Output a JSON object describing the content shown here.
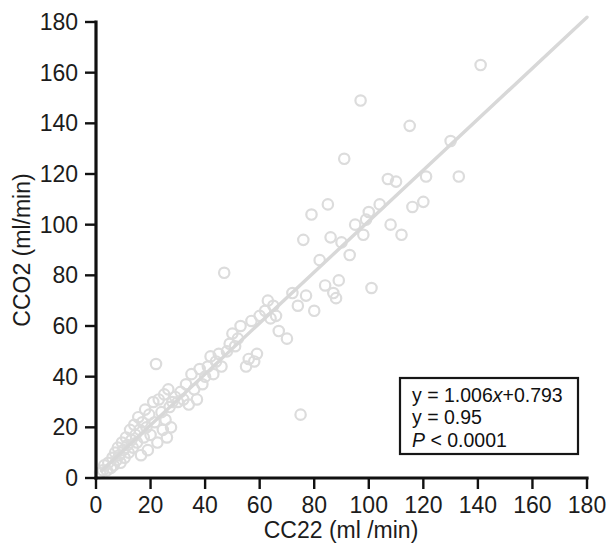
{
  "chart_data": {
    "type": "scatter",
    "title": "",
    "xlabel": "CC22 (ml /min)",
    "ylabel": "CCO2 (ml/min)",
    "xlim": [
      0,
      180
    ],
    "ylim": [
      0,
      180
    ],
    "xticks": [
      0,
      20,
      40,
      60,
      80,
      100,
      120,
      140,
      160,
      180
    ],
    "yticks": [
      0,
      20,
      40,
      60,
      80,
      100,
      120,
      140,
      160,
      180
    ],
    "xtick_labels": [
      "0",
      "20",
      "40",
      "60",
      "80",
      "100",
      "120",
      "140",
      "160",
      "180"
    ],
    "ytick_labels": [
      "0",
      "20",
      "40",
      "60",
      "80",
      "100",
      "120",
      "140",
      "160",
      "180"
    ],
    "grid": false,
    "legend": "none",
    "marker": "open-circle",
    "marker_color": "#dcdcdc",
    "trendline_color": "#d8d8d8",
    "axis_color": "#111111",
    "trendline": {
      "slope": 1.006,
      "intercept": 0.793,
      "x_start": 2,
      "x_end": 180
    },
    "points": [
      [
        1.5,
        2
      ],
      [
        2.5,
        3
      ],
      [
        3,
        5
      ],
      [
        4,
        3
      ],
      [
        4.5,
        6
      ],
      [
        5.5,
        4
      ],
      [
        6,
        8
      ],
      [
        6.5,
        5
      ],
      [
        7,
        10
      ],
      [
        7.5,
        7
      ],
      [
        8,
        12
      ],
      [
        8.5,
        9
      ],
      [
        9,
        6
      ],
      [
        9.5,
        14
      ],
      [
        10,
        11
      ],
      [
        10.5,
        8
      ],
      [
        11,
        16
      ],
      [
        11.5,
        13
      ],
      [
        12,
        10
      ],
      [
        12.5,
        19
      ],
      [
        13,
        15
      ],
      [
        13.5,
        12
      ],
      [
        14,
        21
      ],
      [
        14.5,
        17
      ],
      [
        15,
        14
      ],
      [
        15.5,
        24
      ],
      [
        16,
        19
      ],
      [
        16.5,
        9
      ],
      [
        17,
        22
      ],
      [
        17.5,
        16
      ],
      [
        18,
        27
      ],
      [
        18.5,
        20
      ],
      [
        19,
        11
      ],
      [
        19.5,
        25
      ],
      [
        20,
        17
      ],
      [
        21,
        30
      ],
      [
        21.5,
        22
      ],
      [
        22,
        45
      ],
      [
        22.5,
        14
      ],
      [
        23,
        31
      ],
      [
        24,
        26
      ],
      [
        24.5,
        19
      ],
      [
        25,
        33
      ],
      [
        25.5,
        23
      ],
      [
        26,
        16
      ],
      [
        26.5,
        35
      ],
      [
        27,
        28
      ],
      [
        27.5,
        20
      ],
      [
        28,
        30
      ],
      [
        29,
        32
      ],
      [
        30,
        30
      ],
      [
        31,
        34
      ],
      [
        32,
        31
      ],
      [
        33,
        37
      ],
      [
        34,
        29
      ],
      [
        35,
        41
      ],
      [
        36,
        35
      ],
      [
        37,
        31
      ],
      [
        38,
        43
      ],
      [
        39,
        37
      ],
      [
        40,
        40
      ],
      [
        41,
        44
      ],
      [
        42,
        48
      ],
      [
        43,
        41
      ],
      [
        44,
        46
      ],
      [
        45,
        49
      ],
      [
        46,
        44
      ],
      [
        47,
        81
      ],
      [
        48,
        50
      ],
      [
        49,
        53
      ],
      [
        50,
        57
      ],
      [
        51,
        52
      ],
      [
        52,
        55
      ],
      [
        53,
        60
      ],
      [
        55,
        44
      ],
      [
        56,
        47
      ],
      [
        57,
        62
      ],
      [
        58,
        46
      ],
      [
        59,
        49
      ],
      [
        60,
        64
      ],
      [
        62,
        66
      ],
      [
        63,
        70
      ],
      [
        64,
        63
      ],
      [
        65,
        68
      ],
      [
        66,
        64
      ],
      [
        67,
        58
      ],
      [
        70,
        55
      ],
      [
        72,
        73
      ],
      [
        74,
        68
      ],
      [
        75,
        25
      ],
      [
        76,
        94
      ],
      [
        77,
        72
      ],
      [
        79,
        104
      ],
      [
        80,
        66
      ],
      [
        82,
        86
      ],
      [
        84,
        76
      ],
      [
        85,
        108
      ],
      [
        86,
        95
      ],
      [
        87,
        73
      ],
      [
        88,
        71
      ],
      [
        89,
        78
      ],
      [
        90,
        93
      ],
      [
        91,
        126
      ],
      [
        93,
        88
      ],
      [
        95,
        100
      ],
      [
        97,
        149
      ],
      [
        98,
        96
      ],
      [
        99,
        102
      ],
      [
        100,
        105
      ],
      [
        101,
        75
      ],
      [
        104,
        108
      ],
      [
        107,
        118
      ],
      [
        108,
        100
      ],
      [
        110,
        117
      ],
      [
        112,
        96
      ],
      [
        115,
        139
      ],
      [
        116,
        107
      ],
      [
        120,
        109
      ],
      [
        121,
        119
      ],
      [
        130,
        133
      ],
      [
        133,
        119
      ],
      [
        141,
        163
      ]
    ]
  },
  "stats_box": {
    "line1_prefix": "y = 1.006",
    "line1_var": "x",
    "line1_suffix": "+0.793",
    "line2": "y = 0.95",
    "line3_var": "P",
    "line3_rest": " < 0.0001"
  }
}
